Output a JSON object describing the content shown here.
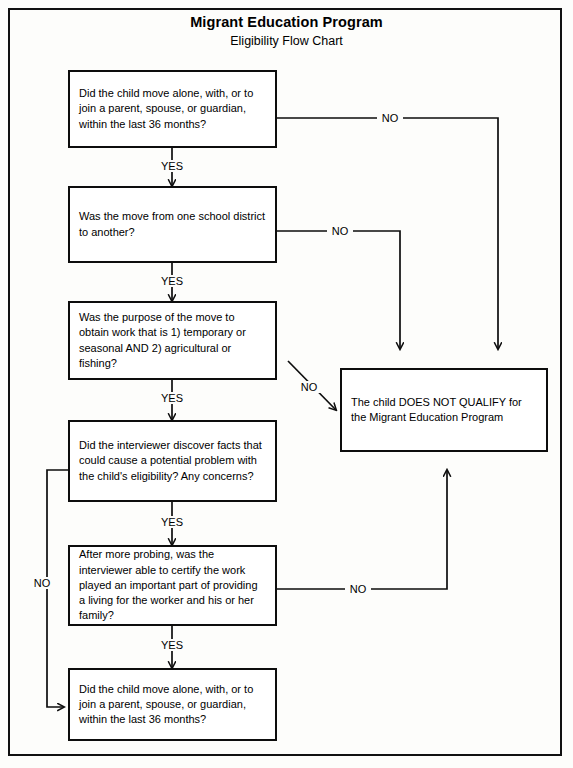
{
  "document": {
    "title": "Migrant Education Program",
    "subtitle": "Eligibility Flow Chart"
  },
  "nodes": [
    {
      "id": "q1",
      "name": "decision-box-move-alone-or-join",
      "text": "Did the child move alone, with, or to join a parent, spouse, or guardian, within the last 36 months?"
    },
    {
      "id": "q2",
      "name": "decision-box-move-between-districts",
      "text": "Was the move from one school district to another?"
    },
    {
      "id": "q3",
      "name": "decision-box-purpose-of-move",
      "text": "Was the purpose of the move to obtain work that is 1) temporary or seasonal AND 2) agricultural or fishing?"
    },
    {
      "id": "q4",
      "name": "decision-box-interviewer-concerns",
      "text": "Did the interviewer discover facts that could cause a potential problem with the child's eligibility?  Any concerns?"
    },
    {
      "id": "q5",
      "name": "decision-box-certify-work-living",
      "text": "After more probing, was the interviewer able to certify the work played an important part of providing a living for the worker and his or her family?"
    },
    {
      "id": "q6",
      "name": "decision-box-move-alone-or-join-repeat",
      "text": "Did the child move alone, with, or to join a parent, spouse,  or guardian, within the last 36 months?"
    },
    {
      "id": "reject",
      "name": "outcome-box-does-not-qualify",
      "text": "The child DOES NOT QUALIFY for the Migrant Education Program"
    }
  ],
  "edge_labels": {
    "yes_1": "YES",
    "yes_2": "YES",
    "yes_3": "YES",
    "yes_4": "YES",
    "yes_5": "YES",
    "no_1": "NO",
    "no_2": "NO",
    "no_3": "NO",
    "no_4": "NO",
    "no_5": "NO"
  },
  "colors": {
    "ink": "#0d0d0d",
    "paper": "#fdfdfb"
  }
}
